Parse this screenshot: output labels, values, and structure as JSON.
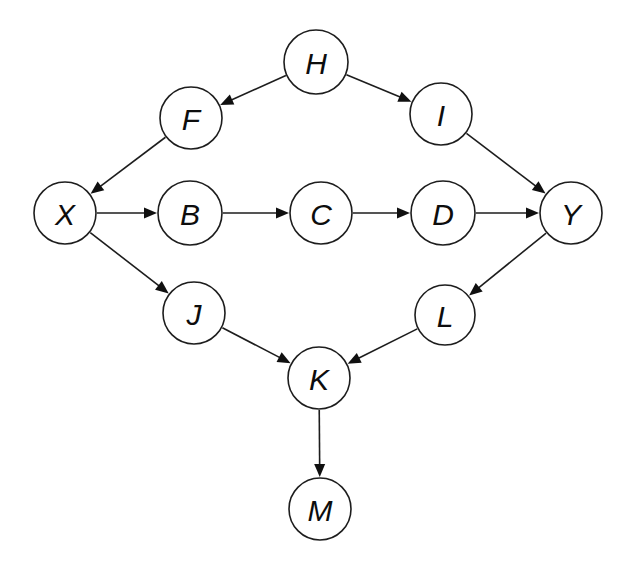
{
  "diagram": {
    "type": "directed-graph",
    "background_color": "#ffffff",
    "stroke_color": "#1d1d1d",
    "label_color": "#0d0d0d",
    "node_fill": "#ffffff",
    "node_radius": 31,
    "canvas": {
      "width": 630,
      "height": 561
    },
    "nodes": [
      {
        "id": "H",
        "label": "H",
        "cx": 316,
        "cy": 62,
        "r": 32
      },
      {
        "id": "F",
        "label": "F",
        "cx": 191,
        "cy": 118,
        "r": 31
      },
      {
        "id": "I",
        "label": "I",
        "cx": 441,
        "cy": 114,
        "r": 31
      },
      {
        "id": "X",
        "label": "X",
        "cx": 65,
        "cy": 213,
        "r": 31
      },
      {
        "id": "B",
        "label": "B",
        "cx": 190,
        "cy": 213,
        "r": 32
      },
      {
        "id": "C",
        "label": "C",
        "cx": 321,
        "cy": 213,
        "r": 31
      },
      {
        "id": "D",
        "label": "D",
        "cx": 443,
        "cy": 213,
        "r": 32
      },
      {
        "id": "Y",
        "label": "Y",
        "cx": 571,
        "cy": 213,
        "r": 31
      },
      {
        "id": "J",
        "label": "J",
        "cx": 194,
        "cy": 313,
        "r": 31
      },
      {
        "id": "L",
        "label": "L",
        "cx": 445,
        "cy": 315,
        "r": 30
      },
      {
        "id": "K",
        "label": "K",
        "cx": 319,
        "cy": 378,
        "r": 31
      },
      {
        "id": "M",
        "label": "M",
        "cx": 320,
        "cy": 509,
        "r": 31
      }
    ],
    "edges": [
      {
        "id": "H-F",
        "from": "H",
        "to": "F",
        "directed": true
      },
      {
        "id": "H-I",
        "from": "H",
        "to": "I",
        "directed": true
      },
      {
        "id": "F-X",
        "from": "F",
        "to": "X",
        "directed": true
      },
      {
        "id": "I-Y",
        "from": "I",
        "to": "Y",
        "directed": true
      },
      {
        "id": "X-B",
        "from": "X",
        "to": "B",
        "directed": true
      },
      {
        "id": "B-C",
        "from": "B",
        "to": "C",
        "directed": true
      },
      {
        "id": "C-D",
        "from": "C",
        "to": "D",
        "directed": true
      },
      {
        "id": "D-Y",
        "from": "D",
        "to": "Y",
        "directed": true
      },
      {
        "id": "X-J",
        "from": "X",
        "to": "J",
        "directed": true
      },
      {
        "id": "Y-L",
        "from": "Y",
        "to": "L",
        "directed": true
      },
      {
        "id": "J-K",
        "from": "J",
        "to": "K",
        "directed": true
      },
      {
        "id": "L-K",
        "from": "L",
        "to": "K",
        "directed": true
      },
      {
        "id": "K-M",
        "from": "K",
        "to": "M",
        "directed": true
      }
    ]
  }
}
